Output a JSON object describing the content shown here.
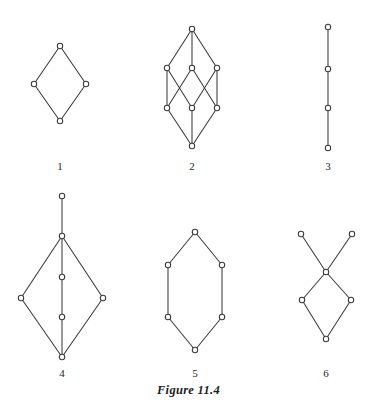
{
  "figure": {
    "caption": "Figure 11.4",
    "caption_x": 0,
    "caption_y": 383,
    "background": "#ffffff",
    "stroke_color": "#3a3a3c",
    "node_fill": "#ffffff",
    "node_radius": 2.7,
    "width": 377,
    "height": 403
  },
  "diagrams": [
    {
      "label": "1",
      "label_x": 60,
      "label_y": 160,
      "description": "diamond lattice with four elements",
      "nodes": [
        {
          "id": "top",
          "x": 60,
          "y": 46
        },
        {
          "id": "left",
          "x": 34,
          "y": 84
        },
        {
          "id": "right",
          "x": 86,
          "y": 84
        },
        {
          "id": "bottom",
          "x": 60,
          "y": 121
        }
      ],
      "edges": [
        [
          "top",
          "left"
        ],
        [
          "top",
          "right"
        ],
        [
          "left",
          "bottom"
        ],
        [
          "right",
          "bottom"
        ]
      ]
    },
    {
      "label": "2",
      "label_x": 192,
      "label_y": 160,
      "description": "eight element lattice with crossing middle edges",
      "nodes": [
        {
          "id": "top",
          "x": 192,
          "y": 29
        },
        {
          "id": "ul",
          "x": 167,
          "y": 68
        },
        {
          "id": "uc",
          "x": 192,
          "y": 68
        },
        {
          "id": "ur",
          "x": 217,
          "y": 68
        },
        {
          "id": "ll",
          "x": 167,
          "y": 108
        },
        {
          "id": "lc",
          "x": 192,
          "y": 108
        },
        {
          "id": "lr",
          "x": 217,
          "y": 108
        },
        {
          "id": "bot",
          "x": 192,
          "y": 146
        }
      ],
      "edges": [
        [
          "top",
          "ul"
        ],
        [
          "top",
          "uc"
        ],
        [
          "top",
          "ur"
        ],
        [
          "ul",
          "ll"
        ],
        [
          "ul",
          "lc"
        ],
        [
          "uc",
          "ll"
        ],
        [
          "uc",
          "lr"
        ],
        [
          "ur",
          "lc"
        ],
        [
          "ur",
          "lr"
        ],
        [
          "ll",
          "bot"
        ],
        [
          "lc",
          "bot"
        ],
        [
          "lr",
          "bot"
        ]
      ]
    },
    {
      "label": "3",
      "label_x": 328,
      "label_y": 160,
      "description": "vertical chain of four elements",
      "nodes": [
        {
          "id": "n1",
          "x": 328,
          "y": 27
        },
        {
          "id": "n2",
          "x": 328,
          "y": 69
        },
        {
          "id": "n3",
          "x": 328,
          "y": 108
        },
        {
          "id": "n4",
          "x": 328,
          "y": 148
        }
      ],
      "edges": [
        [
          "n1",
          "n2"
        ],
        [
          "n2",
          "n3"
        ],
        [
          "n3",
          "n4"
        ]
      ]
    },
    {
      "label": "4",
      "label_x": 62,
      "label_y": 367,
      "description": "tall lattice with pendant top node and central chain",
      "nodes": [
        {
          "id": "apex",
          "x": 62,
          "y": 196
        },
        {
          "id": "hub",
          "x": 62,
          "y": 236
        },
        {
          "id": "mid1",
          "x": 62,
          "y": 277
        },
        {
          "id": "left",
          "x": 21,
          "y": 298
        },
        {
          "id": "right",
          "x": 103,
          "y": 298
        },
        {
          "id": "mid2",
          "x": 62,
          "y": 317
        },
        {
          "id": "bottom",
          "x": 62,
          "y": 357
        }
      ],
      "edges": [
        [
          "apex",
          "hub"
        ],
        [
          "hub",
          "left"
        ],
        [
          "hub",
          "right"
        ],
        [
          "hub",
          "mid1"
        ],
        [
          "mid1",
          "mid2"
        ],
        [
          "mid2",
          "bottom"
        ],
        [
          "left",
          "bottom"
        ],
        [
          "right",
          "bottom"
        ]
      ]
    },
    {
      "label": "5",
      "label_x": 195,
      "label_y": 367,
      "description": "hexagonal lattice of six elements",
      "nodes": [
        {
          "id": "top",
          "x": 195,
          "y": 232
        },
        {
          "id": "ul",
          "x": 168,
          "y": 265
        },
        {
          "id": "ur",
          "x": 222,
          "y": 265
        },
        {
          "id": "ll",
          "x": 168,
          "y": 317
        },
        {
          "id": "lr",
          "x": 222,
          "y": 317
        },
        {
          "id": "bottom",
          "x": 195,
          "y": 350
        }
      ],
      "edges": [
        [
          "top",
          "ul"
        ],
        [
          "top",
          "ur"
        ],
        [
          "ul",
          "ll"
        ],
        [
          "ur",
          "lr"
        ],
        [
          "ll",
          "bottom"
        ],
        [
          "lr",
          "bottom"
        ]
      ]
    },
    {
      "label": "6",
      "label_x": 326,
      "label_y": 367,
      "description": "two maximal elements above a diamond",
      "nodes": [
        {
          "id": "topl",
          "x": 301,
          "y": 234
        },
        {
          "id": "topr",
          "x": 352,
          "y": 234
        },
        {
          "id": "center",
          "x": 326,
          "y": 272
        },
        {
          "id": "left",
          "x": 302,
          "y": 300
        },
        {
          "id": "right",
          "x": 351,
          "y": 300
        },
        {
          "id": "bottom",
          "x": 326,
          "y": 339
        }
      ],
      "edges": [
        [
          "topl",
          "center"
        ],
        [
          "topr",
          "center"
        ],
        [
          "center",
          "left"
        ],
        [
          "center",
          "right"
        ],
        [
          "left",
          "bottom"
        ],
        [
          "right",
          "bottom"
        ]
      ]
    }
  ]
}
